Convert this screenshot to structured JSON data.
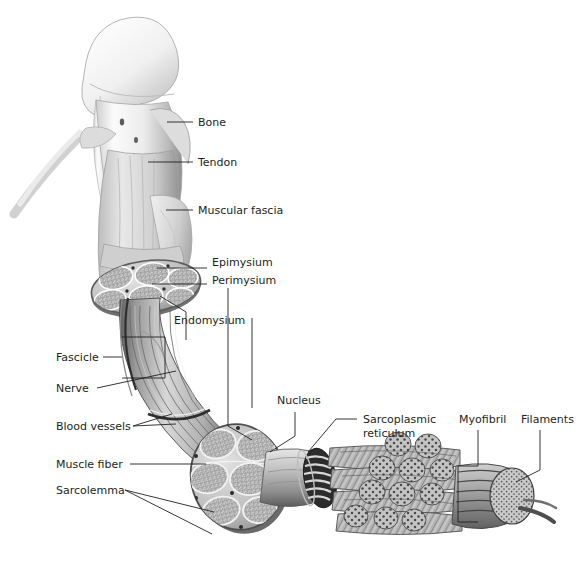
{
  "figure": {
    "background_color": "#ffffff",
    "text_color": "#231f20",
    "leader_color": "#231f20",
    "style": "grayscale anatomical illustration"
  },
  "labels": [
    {
      "id": "bone",
      "text": "Bone",
      "x": 198,
      "y": 126
    },
    {
      "id": "tendon",
      "text": "Tendon",
      "x": 198,
      "y": 166
    },
    {
      "id": "fascia",
      "text": "Muscular fascia",
      "x": 198,
      "y": 214
    },
    {
      "id": "epimysium",
      "text": "Epimysium",
      "x": 212,
      "y": 266
    },
    {
      "id": "perimysium",
      "text": "Perimysium",
      "x": 212,
      "y": 284
    },
    {
      "id": "endomysium",
      "text": "Endomysium",
      "x": 174,
      "y": 324
    },
    {
      "id": "fascicle",
      "text": "Fascicle",
      "x": 56,
      "y": 361
    },
    {
      "id": "nerve",
      "text": "Nerve",
      "x": 56,
      "y": 392
    },
    {
      "id": "blood",
      "text": "Blood vessels",
      "x": 56,
      "y": 430
    },
    {
      "id": "fiber",
      "text": "Muscle fiber",
      "x": 56,
      "y": 468
    },
    {
      "id": "sarcolemma",
      "text": "Sarcolemma",
      "x": 56,
      "y": 494
    },
    {
      "id": "nucleus",
      "text": "Nucleus",
      "x": 277,
      "y": 404
    },
    {
      "id": "sr1",
      "text": "Sarcoplasmic",
      "x": 363,
      "y": 423
    },
    {
      "id": "sr2",
      "text": "reticulum",
      "x": 363,
      "y": 437
    },
    {
      "id": "myofibril",
      "text": "Myofibril",
      "x": 459,
      "y": 423
    },
    {
      "id": "filaments",
      "text": "Filaments",
      "x": 521,
      "y": 423
    }
  ],
  "structures": [
    {
      "id": "bone-head",
      "name": "Humerus head with tendon attachment"
    },
    {
      "id": "tendon-body",
      "name": "Tendon merging into muscle belly"
    },
    {
      "id": "fascia-sheet",
      "name": "Muscular fascia sheet"
    },
    {
      "id": "upper-cross-section",
      "name": "Elliptical muscle cross-section showing fascicles"
    },
    {
      "id": "muscle-belly",
      "name": "Striated muscle belly"
    },
    {
      "id": "lower-cross-section",
      "name": "Round muscle cross-section showing fascicles and endomysium"
    },
    {
      "id": "muscle-fiber-cyl",
      "name": "Single muscle fiber cylinder"
    },
    {
      "id": "sr-lattice",
      "name": "Sarcoplasmic reticulum lattice sleeve"
    },
    {
      "id": "myofibril-bundle",
      "name": "Bundle of myofibrils"
    },
    {
      "id": "filament-cylinder",
      "name": "Myofibril end showing filaments in cross-section"
    }
  ]
}
